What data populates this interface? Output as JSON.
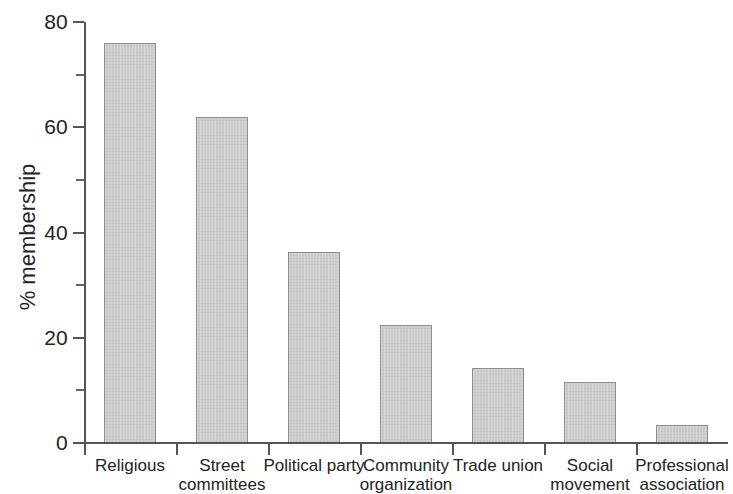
{
  "chart_data": {
    "type": "bar",
    "title": "",
    "xlabel": "",
    "ylabel": "% membership",
    "ylim": [
      0,
      80
    ],
    "grid": false,
    "legend": false,
    "y_major_ticks": [
      0,
      20,
      40,
      60,
      80
    ],
    "y_minor_ticks": [
      10,
      30,
      50,
      70
    ],
    "y_tick_labels": [
      "0",
      "20",
      "40",
      "60",
      "80"
    ],
    "categories": [
      "Religious",
      "Street committees",
      "Political party",
      "Community organization",
      "Trade union",
      "Social movement",
      "Professional association"
    ],
    "category_lines": [
      [
        "Religious",
        ""
      ],
      [
        "Street",
        "committees"
      ],
      [
        "Political party",
        ""
      ],
      [
        "Community",
        "organization"
      ],
      [
        "Trade union",
        ""
      ],
      [
        "Social",
        "movement"
      ],
      [
        "Professional",
        "association"
      ]
    ],
    "values": [
      76,
      62,
      36.2,
      22.4,
      14.2,
      11.5,
      3.5
    ],
    "bar_color": "#cbcbcb",
    "bar_edge_color": "#8e8e8e",
    "axis_color": "#555555",
    "text_color": "#232323"
  }
}
